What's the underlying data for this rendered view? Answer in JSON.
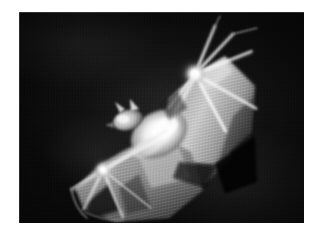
{
  "page": {
    "background_color": "#ffffff",
    "width": 323,
    "height": 239
  },
  "photo": {
    "alt_text": "Grayscale photograph of a bat with outstretched wings against a dark background",
    "subject": "bat",
    "orientation": "diagonal, lower-left to upper-right",
    "frame": {
      "left": 19,
      "top": 12,
      "width": 285,
      "height": 211,
      "background_color": "#070707",
      "border_color": "#ffffff"
    },
    "palette": {
      "background_dark": "#060606",
      "background_mottle": "#1e1e1e",
      "membrane_mid": "#8d8d8d",
      "membrane_light": "#c8c8c8",
      "bone_highlight": "#f2f2f2",
      "body_highlight": "#ffffff",
      "shadow": "#101010"
    },
    "anatomy": [
      {
        "name": "upper-wing-membrane",
        "description": "broad pale membrane stretched between the arm and body, upper right of frame"
      },
      {
        "name": "upper-wing-joint",
        "description": "bright wrist joint where the finger bones radiate outward"
      },
      {
        "name": "finger-bones-upper",
        "description": "four thin bright digits fanning toward upper right and right edge"
      },
      {
        "name": "body-torso",
        "description": "brightest region at image centre, fur catching the flash"
      },
      {
        "name": "head",
        "description": "small head with two pointed ears facing left of centre"
      },
      {
        "name": "lower-wing-membrane",
        "description": "second membrane sweeping to the lower left of the frame"
      },
      {
        "name": "lower-wing-joint",
        "description": "bright joint in the lower left where digits radiate"
      },
      {
        "name": "finger-bones-lower",
        "description": "three thin digits spreading down and left toward the wing edge"
      },
      {
        "name": "tail-membrane",
        "description": "darker membrane trailing to the lower right"
      }
    ]
  },
  "icons": {
    "photo": "photograph-icon"
  }
}
